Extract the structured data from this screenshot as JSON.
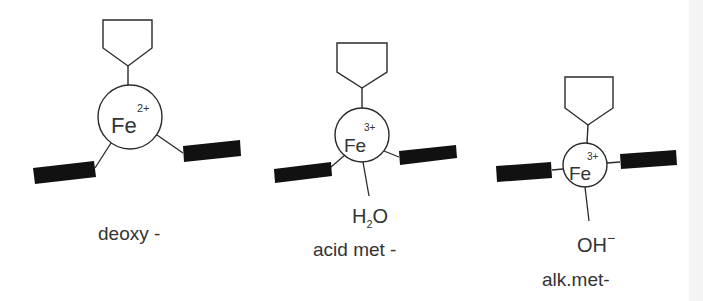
{
  "diagram": {
    "structures": [
      {
        "id": "deoxy",
        "metal": "Fe",
        "charge": "2+",
        "sixth_ligand": "",
        "label": "deoxy -"
      },
      {
        "id": "acid-met",
        "metal": "Fe",
        "charge": "3+",
        "sixth_ligand": "H",
        "sixth_ligand_sub": "2",
        "sixth_ligand_tail": "O",
        "label": "acid met -"
      },
      {
        "id": "alk-met",
        "metal": "Fe",
        "charge": "3+",
        "sixth_ligand": "OH",
        "sixth_ligand_sup": "−",
        "label": "alk.met-"
      }
    ],
    "colors": {
      "line": "#2a2a2a",
      "bar": "#111111",
      "text": "#333333",
      "background": "#ffffff"
    }
  }
}
